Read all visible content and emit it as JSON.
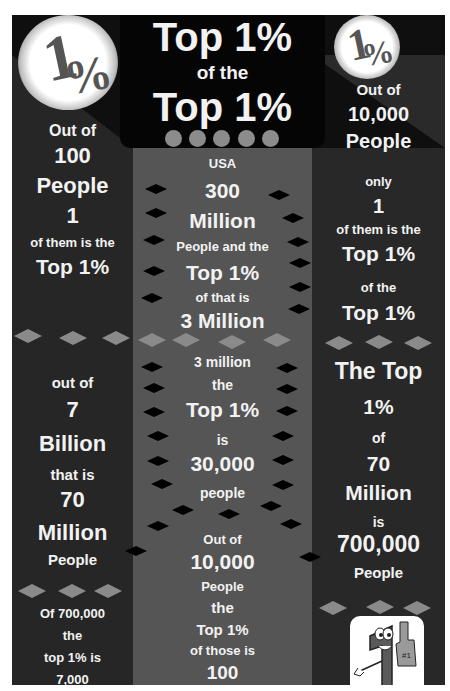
{
  "header": {
    "title_line1": "Top 1%",
    "title_line2": "of the",
    "title_line3": "Top 1%",
    "left_badge_icon": "one-percent-icon",
    "right_badge_icon": "one-percent-icon"
  },
  "left_column": {
    "block1": [
      "Out of",
      "100",
      "People",
      "1",
      "of them is the",
      "Top 1%"
    ],
    "block2": [
      "out of",
      "7",
      "Billion",
      "that is",
      "70",
      "Million",
      "People"
    ],
    "block3": [
      "Of 700,000",
      "the",
      "top 1% is",
      "7,000"
    ]
  },
  "middle_column": {
    "block1": [
      "USA",
      "300",
      "Million",
      "People and the",
      "Top 1%",
      "of that is",
      "3 Million"
    ],
    "block2": [
      "3 million",
      "the",
      "Top 1%",
      "is",
      "30,000",
      "people"
    ],
    "block3": [
      "Out of",
      "10,000",
      "People",
      "the",
      "Top 1%",
      "of those is",
      "100"
    ]
  },
  "right_column": {
    "block1": [
      "Out of",
      "10,000",
      "People",
      "only",
      "1",
      "of them is the",
      "Top 1%",
      "of the",
      "Top 1%"
    ],
    "block2": [
      "The Top",
      "1%",
      "of",
      "70",
      "Million",
      "is",
      "700,000",
      "People"
    ],
    "mascot_icon": "number-one-mascot-icon"
  },
  "colors": {
    "background": "#1e1e1e",
    "middle_column": "#555555",
    "text": "#f2f2f2",
    "accent_diamond": "#8a8a8a"
  }
}
